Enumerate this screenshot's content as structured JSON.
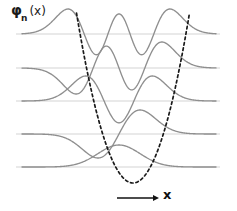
{
  "figure": {
    "y_axis_label": {
      "symbol": "φ",
      "subscript": "n",
      "argument": "(x)"
    },
    "x_axis_label": "x",
    "colors": {
      "background": "#ffffff",
      "wavefunction": "#8f8f8f",
      "baseline": "#d4d4d4",
      "potential": "#1a1a1a",
      "axis_arrow": "#111111",
      "text": "#111111"
    }
  },
  "chart_data": {
    "type": "line",
    "xlabel": "x",
    "ylabel": "φ_n(x)",
    "xlim": [
      -4.6,
      4.6
    ],
    "ylim": [
      0,
      5
    ],
    "grid": false,
    "legend_position": "none",
    "baselines": {
      "label": "energy levels",
      "values": [
        0,
        1,
        2,
        3,
        4
      ],
      "pixel_y": [
        167,
        134,
        101,
        68,
        34
      ],
      "color": "#d4d4d4"
    },
    "series": [
      {
        "name": "n = 0",
        "quantum_number": 0,
        "nodes": 0,
        "parity": "even",
        "baseline_index": 0,
        "hermite": [
          1
        ],
        "amplitude": 1.0,
        "color": "#8f8f8f"
      },
      {
        "name": "n = 1",
        "quantum_number": 1,
        "nodes": 1,
        "parity": "odd",
        "baseline_index": 1,
        "hermite": [
          0,
          2
        ],
        "amplitude": 1.0,
        "color": "#8f8f8f"
      },
      {
        "name": "n = 2",
        "quantum_number": 2,
        "nodes": 2,
        "parity": "even",
        "baseline_index": 2,
        "hermite": [
          -2,
          0,
          4
        ],
        "amplitude": 1.0,
        "color": "#8f8f8f"
      },
      {
        "name": "n = 3",
        "quantum_number": 3,
        "nodes": 3,
        "parity": "odd",
        "baseline_index": 3,
        "hermite": [
          0,
          -12,
          0,
          8
        ],
        "amplitude": 1.0,
        "color": "#8f8f8f"
      },
      {
        "name": "n = 4",
        "quantum_number": 4,
        "nodes": 4,
        "parity": "even",
        "baseline_index": 4,
        "hermite": [
          12,
          0,
          -48,
          0,
          16
        ],
        "amplitude": 1.0,
        "color": "#8f8f8f"
      }
    ],
    "potential": {
      "name": "V(x) = x²",
      "style": "dashed",
      "color": "#1a1a1a",
      "vertex_pixel": [
        133,
        183
      ],
      "top_pixel_y": 13,
      "left_arm_top_x": 76,
      "right_arm_top_x": 189
    },
    "axis_arrow": {
      "x_start": 117,
      "x_end": 159,
      "y": 198,
      "color": "#111111"
    }
  }
}
